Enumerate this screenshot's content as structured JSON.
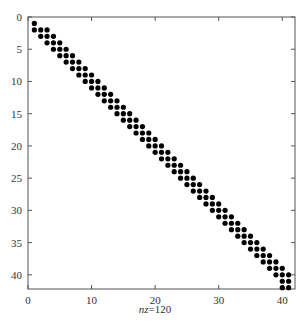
{
  "chart_data": {
    "type": "scatter",
    "subtype": "sparsity-pattern (spy)",
    "title": "",
    "xlabel_italic": "nz",
    "xlabel_rest": "=120",
    "xlabel": "nz=120",
    "ylabel": "",
    "nz": 120,
    "xlim": [
      0,
      42
    ],
    "ylim": [
      42.2,
      0
    ],
    "y_axis_inverted": true,
    "grid": false,
    "legend": null,
    "xticks": [
      0,
      10,
      20,
      30,
      40
    ],
    "yticks": [
      0,
      5,
      10,
      15,
      20,
      25,
      30,
      35,
      40
    ],
    "marker": {
      "shape": "circle",
      "color": "#000000",
      "radius": 2.6
    },
    "pattern_description": "Banded tridiagonal pattern: row r has nonzeros at columns r-1, r, r+1 (clipped to 1..41); row 1 has only column 1; last row 42 has columns 40 and 41",
    "rows": [
      {
        "row": 1,
        "cols": [
          1
        ]
      },
      {
        "row": 2,
        "cols": [
          1,
          2,
          3
        ]
      },
      {
        "row": 3,
        "cols": [
          2,
          3,
          4
        ]
      },
      {
        "row": 4,
        "cols": [
          3,
          4,
          5
        ]
      },
      {
        "row": 5,
        "cols": [
          4,
          5,
          6
        ]
      },
      {
        "row": 6,
        "cols": [
          5,
          6,
          7
        ]
      },
      {
        "row": 7,
        "cols": [
          6,
          7,
          8
        ]
      },
      {
        "row": 8,
        "cols": [
          7,
          8,
          9
        ]
      },
      {
        "row": 9,
        "cols": [
          8,
          9,
          10
        ]
      },
      {
        "row": 10,
        "cols": [
          9,
          10,
          11
        ]
      },
      {
        "row": 11,
        "cols": [
          10,
          11,
          12
        ]
      },
      {
        "row": 12,
        "cols": [
          11,
          12,
          13
        ]
      },
      {
        "row": 13,
        "cols": [
          12,
          13,
          14
        ]
      },
      {
        "row": 14,
        "cols": [
          13,
          14,
          15
        ]
      },
      {
        "row": 15,
        "cols": [
          14,
          15,
          16
        ]
      },
      {
        "row": 16,
        "cols": [
          15,
          16,
          17
        ]
      },
      {
        "row": 17,
        "cols": [
          16,
          17,
          18
        ]
      },
      {
        "row": 18,
        "cols": [
          17,
          18,
          19
        ]
      },
      {
        "row": 19,
        "cols": [
          18,
          19,
          20
        ]
      },
      {
        "row": 20,
        "cols": [
          19,
          20,
          21
        ]
      },
      {
        "row": 21,
        "cols": [
          20,
          21,
          22
        ]
      },
      {
        "row": 22,
        "cols": [
          21,
          22,
          23
        ]
      },
      {
        "row": 23,
        "cols": [
          22,
          23,
          24
        ]
      },
      {
        "row": 24,
        "cols": [
          23,
          24,
          25
        ]
      },
      {
        "row": 25,
        "cols": [
          24,
          25,
          26
        ]
      },
      {
        "row": 26,
        "cols": [
          25,
          26,
          27
        ]
      },
      {
        "row": 27,
        "cols": [
          26,
          27,
          28
        ]
      },
      {
        "row": 28,
        "cols": [
          27,
          28,
          29
        ]
      },
      {
        "row": 29,
        "cols": [
          28,
          29,
          30
        ]
      },
      {
        "row": 30,
        "cols": [
          29,
          30,
          31
        ]
      },
      {
        "row": 31,
        "cols": [
          30,
          31,
          32
        ]
      },
      {
        "row": 32,
        "cols": [
          31,
          32,
          33
        ]
      },
      {
        "row": 33,
        "cols": [
          32,
          33,
          34
        ]
      },
      {
        "row": 34,
        "cols": [
          33,
          34,
          35
        ]
      },
      {
        "row": 35,
        "cols": [
          34,
          35,
          36
        ]
      },
      {
        "row": 36,
        "cols": [
          35,
          36,
          37
        ]
      },
      {
        "row": 37,
        "cols": [
          36,
          37,
          38
        ]
      },
      {
        "row": 38,
        "cols": [
          37,
          38,
          39
        ]
      },
      {
        "row": 39,
        "cols": [
          38,
          39,
          40
        ]
      },
      {
        "row": 40,
        "cols": [
          39,
          40,
          41
        ]
      },
      {
        "row": 41,
        "cols": [
          40,
          41
        ]
      },
      {
        "row": 42,
        "cols": [
          40,
          41
        ]
      }
    ]
  },
  "layout": {
    "axes_px": {
      "left": 28,
      "top": 17,
      "right": 295,
      "bottom": 289
    }
  },
  "colors": {
    "axis": "#555555",
    "marker": "#000000",
    "background": "#ffffff"
  }
}
